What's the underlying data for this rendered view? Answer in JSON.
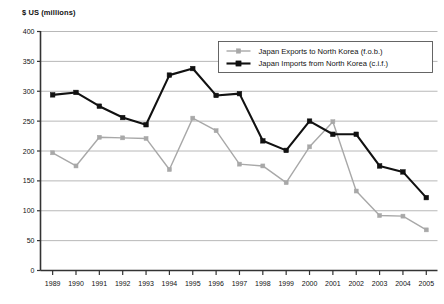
{
  "chart_data": {
    "type": "line",
    "title": "$ US (millions)",
    "xlabel": "",
    "ylabel": "$ US (millions)",
    "x": [
      1989,
      1990,
      1991,
      1992,
      1993,
      1994,
      1995,
      1996,
      1997,
      1998,
      1999,
      2000,
      2001,
      2002,
      2003,
      2004,
      2005
    ],
    "categories": [
      "1989",
      "1990",
      "1991",
      "1992",
      "1993",
      "1994",
      "1995",
      "1996",
      "1997",
      "1998",
      "1999",
      "2000",
      "2001",
      "2002",
      "2003",
      "2004",
      "2005"
    ],
    "series": [
      {
        "name": "Japan Exports to North Korea (f.o.b.)",
        "color": "#a8a8a8",
        "marker": "square",
        "values": [
          197,
          175,
          223,
          222,
          221,
          169,
          255,
          234,
          178,
          175,
          147,
          207,
          249,
          133,
          92,
          91,
          68
        ]
      },
      {
        "name": "Japan Imports from North Korea (c.i.f.)",
        "color": "#111111",
        "marker": "square",
        "values": [
          294,
          298,
          275,
          256,
          244,
          327,
          338,
          293,
          296,
          217,
          201,
          250,
          228,
          228,
          175,
          165,
          122
        ]
      }
    ],
    "ylim": [
      0,
      400
    ],
    "yticks": [
      0,
      50,
      100,
      150,
      200,
      250,
      300,
      350,
      400
    ],
    "ytick_labels": [
      "0",
      "50",
      "100",
      "150",
      "200",
      "250",
      "300",
      "350",
      "400"
    ],
    "grid": true,
    "grid_axis": "y",
    "legend_position": "top-right",
    "legend": [
      "Japan Exports to North Korea (f.o.b.)",
      "Japan Imports from North Korea (c.i.f.)"
    ]
  },
  "colors": {
    "background": "#ffffff",
    "grid": "#b0b0b0",
    "axis": "#333333",
    "exports": "#a8a8a8",
    "imports": "#111111",
    "text": "#111111"
  }
}
